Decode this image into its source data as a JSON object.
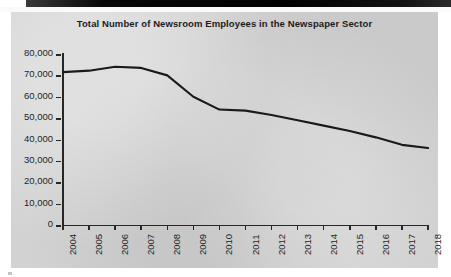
{
  "chart_data": {
    "type": "line",
    "title": "Total Number of Newsroom Employees in the Newspaper Sector",
    "xlabel": "",
    "ylabel": "",
    "categories": [
      "2004",
      "2005",
      "2006",
      "2007",
      "2008",
      "2009",
      "2010",
      "2011",
      "2012",
      "2013",
      "2014",
      "2015",
      "2016",
      "2017",
      "2018"
    ],
    "values": [
      71500,
      72200,
      74000,
      73500,
      70000,
      60000,
      54000,
      53500,
      51500,
      49000,
      46500,
      44000,
      41000,
      37500,
      36000
    ],
    "series": [
      {
        "name": "Newsroom employees",
        "values": [
          71500,
          72200,
          74000,
          73500,
          70000,
          60000,
          54000,
          53500,
          51500,
          49000,
          46500,
          44000,
          41000,
          37500,
          36000
        ]
      }
    ],
    "ylim": [
      0,
      80000
    ],
    "y_ticks": [
      0,
      10000,
      20000,
      30000,
      40000,
      50000,
      60000,
      70000,
      80000
    ],
    "y_tick_labels": [
      "0",
      "10,000",
      "20,000",
      "30,000",
      "40,000",
      "50,000",
      "60,000",
      "70,000",
      "80,000"
    ],
    "grid": false,
    "legend": false,
    "legend_position": "none",
    "line_color": "#1a1a1a",
    "panel_color": "#d2d2d2",
    "text_color": "#1f1f1f"
  }
}
